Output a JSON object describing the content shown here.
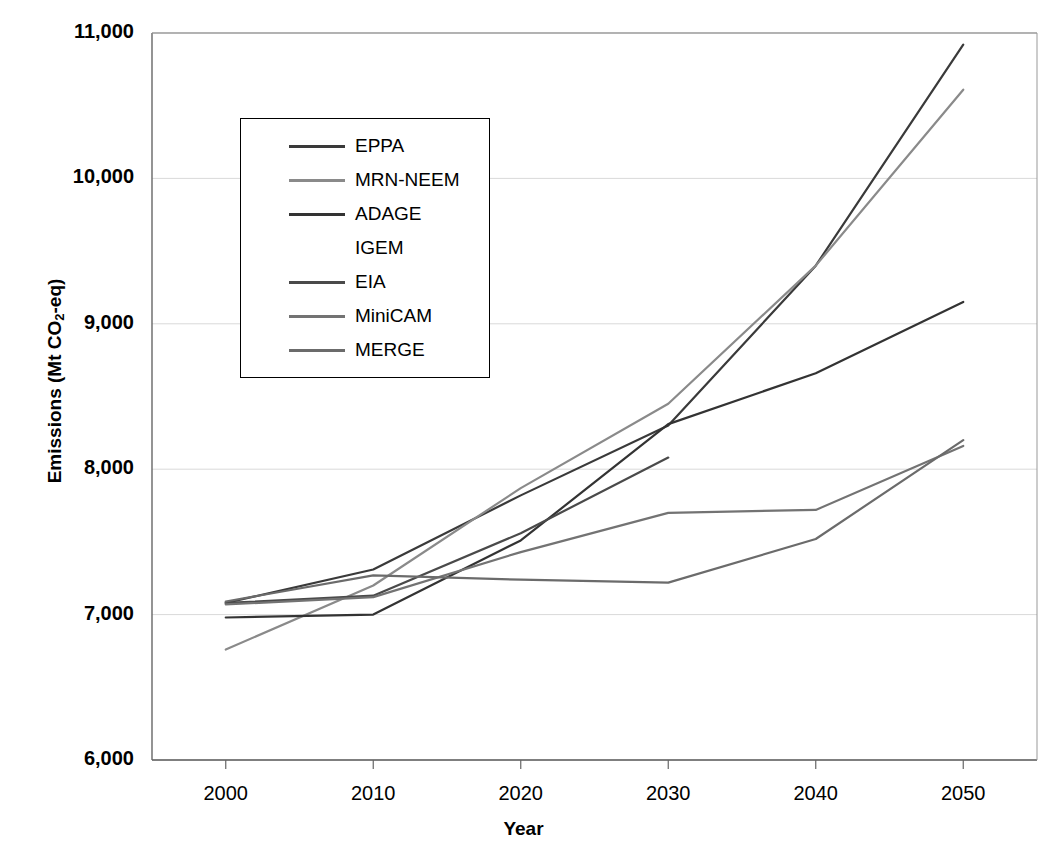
{
  "chart_data": {
    "type": "line",
    "title": "",
    "xlabel": "Year",
    "ylabel": "Emissions (Mt CO2-eq)",
    "ylabel_parts": {
      "pre": "Emissions (Mt CO",
      "sub": "2",
      "post": "-eq)"
    },
    "x": [
      2000,
      2010,
      2020,
      2030,
      2040,
      2050
    ],
    "xtick_labels": [
      "2000",
      "2010",
      "2020",
      "2030",
      "2040",
      "2050"
    ],
    "ytick_labels": [
      "11,000",
      "10,000",
      "9,000",
      "8,000",
      "7,000",
      "6,000"
    ],
    "yticks": [
      11000,
      10000,
      9000,
      8000,
      7000,
      6000
    ],
    "xlim": [
      1995,
      2055
    ],
    "ylim": [
      6000,
      11000
    ],
    "grid": true,
    "legend_position": "upper-left-inset",
    "series": [
      {
        "name": "EPPA",
        "color": "#3a3a3a",
        "has_swatch": true,
        "x": [
          2000,
          2010,
          2020,
          2030,
          2040,
          2050
        ],
        "values": [
          7080,
          7310,
          7820,
          8300,
          9400,
          10920
        ]
      },
      {
        "name": "MRN-NEEM",
        "color": "#8a8a8a",
        "has_swatch": true,
        "x": [
          2000,
          2010,
          2020,
          2030,
          2040,
          2050
        ],
        "values": [
          6760,
          7200,
          7870,
          8450,
          9400,
          10610
        ]
      },
      {
        "name": "ADAGE",
        "color": "#333333",
        "has_swatch": true,
        "x": [
          2000,
          2010,
          2020,
          2030,
          2040,
          2050
        ],
        "values": [
          6980,
          7000,
          7510,
          8310,
          8660,
          9150
        ]
      },
      {
        "name": "IGEM",
        "color": "#555555",
        "has_swatch": false,
        "x": [],
        "values": []
      },
      {
        "name": "EIA",
        "color": "#4a4a4a",
        "has_swatch": true,
        "x": [
          2000,
          2010,
          2020,
          2030
        ],
        "values": [
          7080,
          7130,
          7560,
          8080
        ]
      },
      {
        "name": "MiniCAM",
        "color": "#737373",
        "has_swatch": true,
        "x": [
          2000,
          2010,
          2020,
          2030,
          2040,
          2050
        ],
        "values": [
          7070,
          7120,
          7430,
          7700,
          7720,
          8160
        ]
      },
      {
        "name": "MERGE",
        "color": "#6b6b6b",
        "has_swatch": true,
        "x": [
          2000,
          2010,
          2020,
          2030,
          2040,
          2050
        ],
        "values": [
          7090,
          7270,
          7240,
          7220,
          7520,
          8200
        ]
      }
    ]
  },
  "legend": {
    "entries": [
      {
        "label": "EPPA"
      },
      {
        "label": "MRN-NEEM"
      },
      {
        "label": "ADAGE"
      },
      {
        "label": "IGEM"
      },
      {
        "label": "EIA"
      },
      {
        "label": "MiniCAM"
      },
      {
        "label": "MERGE"
      }
    ]
  },
  "axes": {
    "frame_color": "#999999",
    "grid_color": "#d9d9d9",
    "text_color": "#000000"
  }
}
